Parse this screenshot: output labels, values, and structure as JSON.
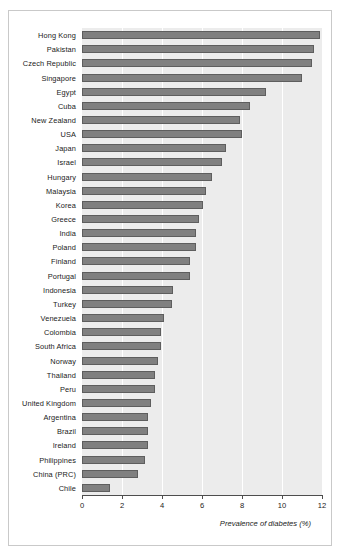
{
  "chart_data": {
    "type": "bar",
    "orientation": "horizontal",
    "title": "",
    "subtitle": "",
    "xlabel": "Prevalence of diabetes (%)",
    "ylabel": "",
    "xlim": [
      0,
      12
    ],
    "xticks": [
      0,
      2,
      4,
      6,
      8,
      10,
      12
    ],
    "xtick_labels": [
      "0",
      "2",
      "4",
      "6",
      "8",
      "10",
      "12"
    ],
    "grid": "vertical-white-gridlines",
    "legend": null,
    "categories": [
      "Hong Kong",
      "Pakistan",
      "Czech Republic",
      "Singapore",
      "Egypt",
      "Cuba",
      "New Zealand",
      "USA",
      "Japan",
      "Israel",
      "Hungary",
      "Malaysia",
      "Korea",
      "Greece",
      "India",
      "Poland",
      "Finland",
      "Portugal",
      "Indonesia",
      "Turkey",
      "Venezuela",
      "Colombia",
      "South Africa",
      "Norway",
      "Thailand",
      "Peru",
      "United Kingdom",
      "Argentina",
      "Brazil",
      "Ireland",
      "Philippines",
      "China (PRC)",
      "Chile"
    ],
    "values": [
      11.9,
      11.6,
      11.5,
      11.0,
      9.2,
      8.4,
      7.9,
      8.0,
      7.2,
      7.0,
      6.5,
      6.2,
      6.05,
      5.85,
      5.7,
      5.7,
      5.4,
      5.4,
      4.55,
      4.5,
      4.1,
      3.95,
      3.95,
      3.8,
      3.65,
      3.65,
      3.45,
      3.3,
      3.3,
      3.3,
      3.15,
      2.8,
      1.4
    ],
    "colors": {
      "bar_fill": "#808080",
      "bar_edge": "#5e5e5e",
      "plot_background": "#ececec",
      "gridline": "#ffffff",
      "axis": "#4d4d4d",
      "text": "#1a1a1a",
      "figure_background": "#ffffff",
      "frame_border": "#c9c9c9"
    }
  }
}
